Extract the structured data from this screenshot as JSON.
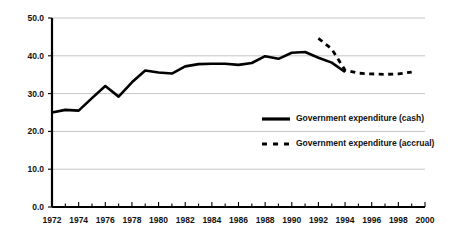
{
  "chart_data": {
    "type": "line",
    "title": "",
    "subtitle": "",
    "xlabel": "",
    "ylabel": "",
    "xlim": [
      1972,
      2000
    ],
    "ylim": [
      0.0,
      50.0
    ],
    "grid": true,
    "legend_position": "inside-right",
    "y_ticks": [
      "0.0",
      "10.0",
      "20.0",
      "30.0",
      "40.0",
      "50.0"
    ],
    "y_tick_values": [
      0.0,
      10.0,
      20.0,
      30.0,
      40.0,
      50.0
    ],
    "x_ticks": [
      "1972",
      "1974",
      "1976",
      "1978",
      "1980",
      "1982",
      "1984",
      "1986",
      "1988",
      "1990",
      "1992",
      "1994",
      "1996",
      "1998",
      "2000"
    ],
    "x_tick_values": [
      1972,
      1974,
      1976,
      1978,
      1980,
      1982,
      1984,
      1986,
      1988,
      1990,
      1992,
      1994,
      1996,
      1998,
      2000
    ],
    "x_minor_tick_values": [
      1973,
      1975,
      1977,
      1979,
      1981,
      1983,
      1985,
      1987,
      1989,
      1991,
      1993,
      1995,
      1997,
      1999
    ],
    "series": [
      {
        "name": "Government expenditure (cash)",
        "style": "solid",
        "color": "#000000",
        "x": [
          1972,
          1973,
          1974,
          1975,
          1976,
          1977,
          1978,
          1979,
          1980,
          1981,
          1982,
          1983,
          1984,
          1985,
          1986,
          1987,
          1988,
          1989,
          1990,
          1991,
          1992,
          1993,
          1994
        ],
        "values": [
          25.0,
          25.7,
          25.5,
          28.8,
          32.0,
          29.2,
          33.0,
          36.1,
          35.6,
          35.3,
          37.2,
          37.8,
          37.9,
          37.9,
          37.6,
          38.1,
          39.9,
          39.2,
          40.8,
          41.0,
          39.5,
          38.2,
          35.7
        ]
      },
      {
        "name": "Government expenditure (accrual)",
        "style": "dashed",
        "color": "#000000",
        "x": [
          1992,
          1993,
          1994,
          1995,
          1996,
          1997,
          1998,
          1999
        ],
        "values": [
          44.6,
          41.8,
          36.2,
          35.4,
          35.2,
          35.1,
          35.2,
          35.7
        ]
      }
    ]
  },
  "legend": {
    "items": [
      {
        "label": "Government expenditure (cash)",
        "style": "solid"
      },
      {
        "label": "Government expenditure (accrual)",
        "style": "dashed"
      }
    ]
  }
}
